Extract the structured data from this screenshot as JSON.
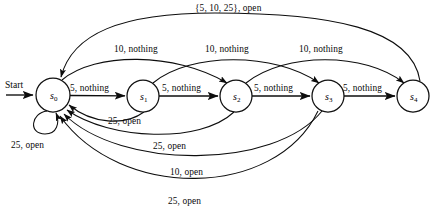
{
  "diagram": {
    "type": "finite-state-machine",
    "title": "",
    "start_label": "Start",
    "states": [
      {
        "id": "s0",
        "label": "s",
        "sub": "0",
        "cx": 53,
        "cy": 95,
        "r": 17
      },
      {
        "id": "s1",
        "label": "s",
        "sub": "1",
        "cx": 143,
        "cy": 96,
        "r": 16
      },
      {
        "id": "s2",
        "label": "s",
        "sub": "2",
        "cx": 236,
        "cy": 96,
        "r": 16
      },
      {
        "id": "s3",
        "label": "s",
        "sub": "3",
        "cx": 328,
        "cy": 96,
        "r": 16
      },
      {
        "id": "s4",
        "label": "s",
        "sub": "4",
        "cx": 413,
        "cy": 96,
        "r": 16
      }
    ],
    "transitions": [
      {
        "from": "s0",
        "to": "s1",
        "label": "5, nothing",
        "label_x": 70,
        "label_y": 84
      },
      {
        "from": "s1",
        "to": "s2",
        "label": "5, nothing",
        "label_x": 162,
        "label_y": 84
      },
      {
        "from": "s2",
        "to": "s3",
        "label": "5, nothing",
        "label_x": 254,
        "label_y": 84
      },
      {
        "from": "s3",
        "to": "s4",
        "label": "5, nothing",
        "label_x": 343,
        "label_y": 84
      },
      {
        "from": "s0",
        "to": "s2",
        "label": "10, nothing",
        "label_x": 114,
        "label_y": 45
      },
      {
        "from": "s1",
        "to": "s3",
        "label": "10, nothing",
        "label_x": 205,
        "label_y": 45
      },
      {
        "from": "s2",
        "to": "s4",
        "label": "10, nothing",
        "label_x": 299,
        "label_y": 45
      },
      {
        "from": "s4",
        "to": "s0",
        "label": "{5, 10, 25}, open",
        "label_x": 195,
        "label_y": 5
      },
      {
        "from": "s0",
        "to": "s0",
        "label": "25, open",
        "label_x": 11,
        "label_y": 141
      },
      {
        "from": "s1",
        "to": "s0",
        "label": "25, open",
        "label_x": 108,
        "label_y": 117
      },
      {
        "from": "s2",
        "to": "s0",
        "label": "25, open",
        "label_x": 153,
        "label_y": 142
      },
      {
        "from": "s3",
        "to": "s0",
        "label": "10, open",
        "label_x": 170,
        "label_y": 168
      },
      {
        "from": "s3",
        "to": "s0",
        "label": "25, open",
        "label_x": 168,
        "label_y": 197
      }
    ],
    "colors": {
      "stroke": "#0d0d0d",
      "node_fill": "#ffffff",
      "background": "#ffffff",
      "text": "#0a0a0a"
    }
  }
}
